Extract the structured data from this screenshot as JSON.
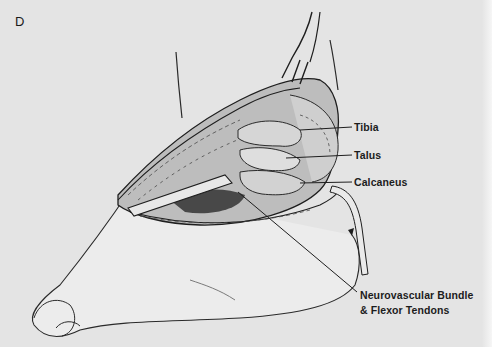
{
  "figure": {
    "panel_letter": "D",
    "background_color": "#e4e4e4",
    "ink_color": "#1c1c1c",
    "labels": [
      {
        "id": "tibia",
        "text": "Tibia"
      },
      {
        "id": "talus",
        "text": "Talus"
      },
      {
        "id": "calcaneus",
        "text": "Calcaneus"
      },
      {
        "id": "neurovascular",
        "line1": "Neurovascular Bundle",
        "line2": "& Flexor Tendons"
      }
    ]
  }
}
